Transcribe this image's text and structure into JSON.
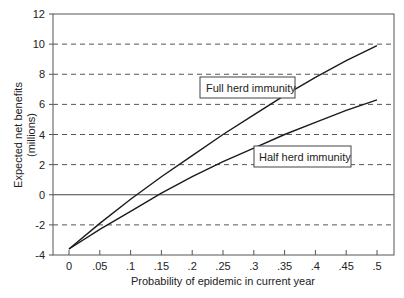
{
  "chart_data": {
    "type": "line",
    "title": "",
    "xlabel": "Probability of epidemic in current year",
    "ylabel": "Expected net benefits",
    "ylabel_sub": "(millions)",
    "xlim": [
      0,
      0.5
    ],
    "ylim": [
      -4,
      12
    ],
    "x_ticks": [
      0,
      0.05,
      0.1,
      0.15,
      0.2,
      0.25,
      0.3,
      0.35,
      0.4,
      0.45,
      0.5
    ],
    "x_tick_labels": [
      "0",
      ".05",
      ".1",
      ".15",
      ".2",
      ".25",
      ".3",
      ".35",
      ".4",
      ".45",
      ".5"
    ],
    "y_ticks": [
      -4,
      -2,
      0,
      2,
      4,
      6,
      8,
      10,
      12
    ],
    "y_tick_labels": [
      "-4",
      "-2",
      "0",
      "2",
      "4",
      "6",
      "8",
      "10",
      "12"
    ],
    "grid": "dashed horizontal at even y values; solid line at y=0",
    "legend": "inline callout labels",
    "x": [
      0,
      0.05,
      0.1,
      0.15,
      0.2,
      0.25,
      0.3,
      0.35,
      0.4,
      0.45,
      0.5
    ],
    "series": [
      {
        "name": "Full herd immunity",
        "values": [
          -3.6,
          -1.9,
          -0.3,
          1.2,
          2.6,
          4.0,
          5.3,
          6.6,
          7.8,
          8.9,
          9.9
        ]
      },
      {
        "name": "Half herd immunity",
        "values": [
          -3.6,
          -2.3,
          -1.1,
          0.1,
          1.2,
          2.2,
          3.1,
          4.0,
          4.8,
          5.6,
          6.3
        ]
      }
    ],
    "annotations": [
      {
        "text": "Full herd immunity",
        "x": 0.27,
        "y": 8.4
      },
      {
        "text": "Half herd immunity",
        "x": 0.38,
        "y": 2.2
      }
    ]
  },
  "labels": {
    "xlabel": "Probability of epidemic in current year",
    "ylabel": "Expected net benefits",
    "ylabel_sub": "(millions)",
    "full_callout": "Full herd immunity",
    "half_callout": "Half herd immunity"
  }
}
